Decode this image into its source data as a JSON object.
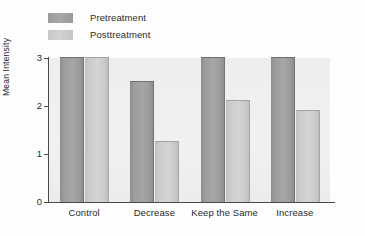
{
  "chart_data": {
    "type": "bar",
    "title": "",
    "xlabel": "",
    "ylabel": "Mean Intensity",
    "categories": [
      "Control",
      "Decrease",
      "Keep the Same",
      "Increase"
    ],
    "series": [
      {
        "name": "Pretreatment",
        "color": "#9e9e9e",
        "values": [
          3.0,
          2.5,
          3.0,
          3.0
        ]
      },
      {
        "name": "Posttreatment",
        "color": "#cccccc",
        "values": [
          3.0,
          1.25,
          2.1,
          1.9
        ]
      }
    ],
    "ylim": [
      0,
      3
    ],
    "yticks": [
      "0",
      "1",
      "2",
      "3"
    ],
    "grid": false,
    "legend_position": "top-left",
    "plot_background": "#efefef"
  },
  "legend": {
    "items": [
      {
        "label": "Pretreatment"
      },
      {
        "label": "Posttreatment"
      }
    ]
  },
  "axes": {
    "y_title": "Mean Intensity",
    "y_tick_labels": [
      "3",
      "2",
      "1",
      "0"
    ],
    "x_tick_labels": [
      "Control",
      "Decrease",
      "Keep the Same",
      "Increase"
    ]
  }
}
